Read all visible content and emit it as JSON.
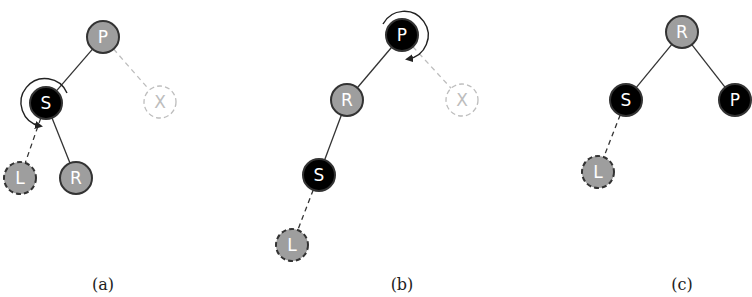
{
  "figure": {
    "top_cut_text": "…",
    "colors": {
      "red_node": "#9e9e9e",
      "black_node": "#000000",
      "node_stroke": "#333333",
      "ghost_stroke": "#bdbdbd",
      "edge": "#333333",
      "ghost_edge": "#bdbdbd",
      "background": "#ffffff"
    },
    "panels": [
      {
        "id": "a",
        "caption": "(a)",
        "caption_pos": [
          103,
          290
        ],
        "nodes": [
          {
            "key": "P",
            "label": "P",
            "x": 103,
            "y": 37,
            "color": "red",
            "style": "solid"
          },
          {
            "key": "S",
            "label": "S",
            "x": 46,
            "y": 103,
            "color": "black",
            "style": "solid"
          },
          {
            "key": "X",
            "label": "X",
            "x": 160,
            "y": 102,
            "color": "none",
            "style": "ghost"
          },
          {
            "key": "L",
            "label": "L",
            "x": 20,
            "y": 178,
            "color": "red",
            "style": "dashed"
          },
          {
            "key": "R",
            "label": "R",
            "x": 76,
            "y": 178,
            "color": "red",
            "style": "solid"
          }
        ],
        "edges": [
          {
            "from": "P",
            "to": "S",
            "style": "solid"
          },
          {
            "from": "P",
            "to": "X",
            "style": "ghost"
          },
          {
            "from": "S",
            "to": "L",
            "style": "dashed"
          },
          {
            "from": "S",
            "to": "R",
            "style": "solid"
          }
        ],
        "rotation": {
          "around": "S",
          "direction": "counterclockwise"
        }
      },
      {
        "id": "b",
        "caption": "(b)",
        "caption_pos": [
          402,
          290
        ],
        "nodes": [
          {
            "key": "P",
            "label": "P",
            "x": 402,
            "y": 35,
            "color": "black",
            "style": "solid"
          },
          {
            "key": "R",
            "label": "R",
            "x": 347,
            "y": 100,
            "color": "red",
            "style": "solid"
          },
          {
            "key": "X",
            "label": "X",
            "x": 462,
            "y": 100,
            "color": "none",
            "style": "ghost"
          },
          {
            "key": "S",
            "label": "S",
            "x": 319,
            "y": 175,
            "color": "black",
            "style": "solid"
          },
          {
            "key": "L",
            "label": "L",
            "x": 292,
            "y": 245,
            "color": "red",
            "style": "dashed"
          }
        ],
        "edges": [
          {
            "from": "P",
            "to": "R",
            "style": "solid"
          },
          {
            "from": "P",
            "to": "X",
            "style": "ghost"
          },
          {
            "from": "R",
            "to": "S",
            "style": "solid"
          },
          {
            "from": "S",
            "to": "L",
            "style": "dashed"
          }
        ],
        "rotation": {
          "around": "P",
          "direction": "clockwise"
        }
      },
      {
        "id": "c",
        "caption": "(c)",
        "caption_pos": [
          682,
          290
        ],
        "nodes": [
          {
            "key": "R",
            "label": "R",
            "x": 682,
            "y": 32,
            "color": "red",
            "style": "solid"
          },
          {
            "key": "S",
            "label": "S",
            "x": 626,
            "y": 100,
            "color": "black",
            "style": "solid"
          },
          {
            "key": "P",
            "label": "P",
            "x": 735,
            "y": 100,
            "color": "black",
            "style": "solid"
          },
          {
            "key": "L",
            "label": "L",
            "x": 598,
            "y": 172,
            "color": "red",
            "style": "dashed"
          }
        ],
        "edges": [
          {
            "from": "R",
            "to": "S",
            "style": "solid"
          },
          {
            "from": "R",
            "to": "P",
            "style": "solid"
          },
          {
            "from": "S",
            "to": "L",
            "style": "dashed"
          }
        ]
      }
    ]
  }
}
